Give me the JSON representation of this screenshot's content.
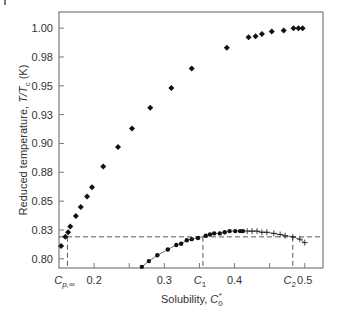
{
  "chart_data": {
    "type": "scatter",
    "title": "",
    "xlabel": "Solubility, C0*",
    "xlabel_main": "Solubility, ",
    "xlabel_sym": "C",
    "xlabel_sub": "0",
    "xlabel_sup": "*",
    "ylabel": "Reduced temperature, T/Tc (K)",
    "ylabel_main": "Reduced temperature, ",
    "ylabel_sym": "T/T",
    "ylabel_sub": "c",
    "ylabel_unit": " (K)",
    "xlim": [
      0.15,
      0.526
    ],
    "ylim": [
      0.792,
      1.014
    ],
    "grid": false,
    "legend": null,
    "x_ticks": [
      {
        "value": 0.2,
        "label": "0.2"
      },
      {
        "value": 0.25,
        "label": ""
      },
      {
        "value": 0.3,
        "label": "0.3"
      },
      {
        "value": 0.35,
        "label": ""
      },
      {
        "value": 0.4,
        "label": "0.4"
      },
      {
        "value": 0.45,
        "label": ""
      },
      {
        "value": 0.5,
        "label": "0.5"
      }
    ],
    "y_ticks": [
      {
        "value": 1.0,
        "label": "1.00"
      },
      {
        "value": 0.975,
        "label": "0.98"
      },
      {
        "value": 0.95,
        "label": "0.95"
      },
      {
        "value": 0.925,
        "label": "0.93"
      },
      {
        "value": 0.9,
        "label": "0.90"
      },
      {
        "value": 0.875,
        "label": "0.88"
      },
      {
        "value": 0.85,
        "label": "0.85"
      },
      {
        "value": 0.825,
        "label": "0.83"
      },
      {
        "value": 0.8,
        "label": "0.80"
      }
    ],
    "series": [
      {
        "name": "upper branch",
        "marker": "diamond",
        "x": [
          0.153,
          0.159,
          0.163,
          0.166,
          0.174,
          0.181,
          0.19,
          0.197,
          0.213,
          0.234,
          0.254,
          0.28,
          0.31,
          0.339,
          0.389,
          0.42,
          0.43,
          0.439,
          0.453,
          0.47,
          0.484,
          0.491,
          0.497
        ],
        "y": [
          0.811,
          0.819,
          0.823,
          0.828,
          0.837,
          0.845,
          0.854,
          0.862,
          0.88,
          0.897,
          0.913,
          0.931,
          0.948,
          0.965,
          0.983,
          0.992,
          0.993,
          0.995,
          0.997,
          0.998,
          1.0,
          1.0,
          1.0
        ]
      },
      {
        "name": "lower branch",
        "marker": "circle",
        "line": true,
        "x": [
          0.268,
          0.278,
          0.29,
          0.305,
          0.317,
          0.324,
          0.332,
          0.339,
          0.348,
          0.359,
          0.365,
          0.371,
          0.379,
          0.386,
          0.393,
          0.401,
          0.408,
          0.412
        ],
        "y": [
          0.793,
          0.798,
          0.803,
          0.808,
          0.812,
          0.813,
          0.816,
          0.817,
          0.818,
          0.82,
          0.821,
          0.822,
          0.822,
          0.823,
          0.824,
          0.824,
          0.824,
          0.824
        ]
      },
      {
        "name": "lower branch (crosses)",
        "marker": "cross",
        "line": true,
        "x": [
          0.418,
          0.425,
          0.432,
          0.439,
          0.446,
          0.456,
          0.465,
          0.472,
          0.483,
          0.493,
          0.5
        ],
        "y": [
          0.824,
          0.824,
          0.824,
          0.823,
          0.823,
          0.822,
          0.821,
          0.82,
          0.819,
          0.817,
          0.814
        ]
      }
    ],
    "reference_lines": {
      "horizontal": {
        "y": 0.819,
        "style": "dashed"
      },
      "vertical": [
        {
          "x": 0.162,
          "label": "Cp,∞",
          "sym": "C",
          "sub": "p,∞"
        },
        {
          "x": 0.355,
          "label": "C1",
          "sym": "C",
          "sub": "1"
        },
        {
          "x": 0.483,
          "label": "C2",
          "sym": "C",
          "sub": "2"
        }
      ]
    }
  },
  "colors": {
    "frame": "#7a7a7a",
    "marker": "#111111",
    "dash": "#444444",
    "text": "#333333"
  }
}
